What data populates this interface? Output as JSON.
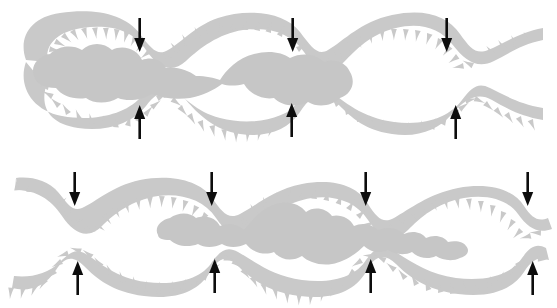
{
  "figure": {
    "width": 557,
    "height": 308,
    "background_color": "#ffffff",
    "wall_color": "#c9c9c9",
    "bolus_color": "#c6c6c6",
    "arrow_color": "#0d0d0d",
    "panel_count": 2
  },
  "panels": [
    {
      "id": "panel-top",
      "label": "Top panel",
      "y_range": [
        5,
        140
      ],
      "left_end": "closed",
      "right_end": "open",
      "bolus": {
        "label": "chyme-bolus-top",
        "lobe_count": 3,
        "x_range": [
          30,
          225
        ],
        "description": "Large lobed mass with narrow neck joining a smaller rounded lobe"
      },
      "arrows_down": [
        {
          "name": "constriction-arrow-top-1",
          "x": 140,
          "y": 18
        },
        {
          "name": "constriction-arrow-top-2",
          "x": 293,
          "y": 18
        },
        {
          "name": "constriction-arrow-top-3",
          "x": 447,
          "y": 18
        }
      ],
      "arrows_up": [
        {
          "name": "constriction-arrow-bottom-1",
          "x": 140,
          "y": 106
        },
        {
          "name": "constriction-arrow-bottom-2",
          "x": 292,
          "y": 104
        },
        {
          "name": "constriction-arrow-bottom-3",
          "x": 456,
          "y": 106
        }
      ]
    },
    {
      "id": "panel-bottom",
      "label": "Bottom panel",
      "y_range": [
        170,
        302
      ],
      "left_end": "open",
      "right_end": "open",
      "bolus": {
        "label": "chyme-bolus-bottom",
        "lobe_count": 4,
        "x_range": [
          155,
          400
        ],
        "description": "Chain of segmented lobes connected by narrow necks"
      },
      "arrows_down": [
        {
          "name": "constriction-arrow-top-1",
          "x": 75,
          "y": 172
        },
        {
          "name": "constriction-arrow-top-2",
          "x": 212,
          "y": 172
        },
        {
          "name": "constriction-arrow-top-3",
          "x": 366,
          "y": 172
        },
        {
          "name": "constriction-arrow-top-4",
          "x": 528,
          "y": 172
        }
      ],
      "arrows_up": [
        {
          "name": "constriction-arrow-bottom-1",
          "x": 78,
          "y": 262
        },
        {
          "name": "constriction-arrow-bottom-2",
          "x": 215,
          "y": 260
        },
        {
          "name": "constriction-arrow-bottom-3",
          "x": 371,
          "y": 260
        },
        {
          "name": "constriction-arrow-bottom-4",
          "x": 533,
          "y": 262
        }
      ]
    }
  ]
}
